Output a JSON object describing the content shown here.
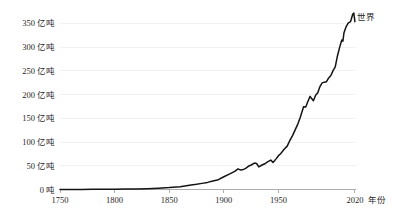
{
  "chart_data": {
    "type": "line",
    "title": "",
    "subtitle": "",
    "xlabel": "年份",
    "ylabel": "",
    "xlim": [
      1750,
      2021
    ],
    "ylim": [
      0,
      370
    ],
    "grid": true,
    "legend_position": "inline-right-of-peak",
    "unit": "亿吨",
    "y_ticks": [
      0,
      50,
      100,
      150,
      200,
      250,
      300,
      350
    ],
    "y_tick_labels": [
      "0 吨",
      "50 亿吨",
      "100 亿吨",
      "150 亿吨",
      "200 亿吨",
      "250 亿吨",
      "300 亿吨",
      "350 亿吨"
    ],
    "x_ticks": [
      1750,
      1800,
      1850,
      1900,
      1950,
      2020
    ],
    "x_tick_labels": [
      "1750",
      "1800",
      "1850",
      "1900",
      "1950",
      "2020"
    ],
    "series": [
      {
        "name": "世界",
        "label": "世界",
        "color": "#141414",
        "x": [
          1750,
          1760,
          1770,
          1780,
          1790,
          1800,
          1810,
          1820,
          1830,
          1840,
          1850,
          1860,
          1870,
          1875,
          1880,
          1885,
          1890,
          1895,
          1900,
          1905,
          1910,
          1913,
          1915,
          1918,
          1920,
          1923,
          1925,
          1928,
          1930,
          1932,
          1935,
          1938,
          1940,
          1943,
          1945,
          1946,
          1948,
          1950,
          1952,
          1955,
          1958,
          1960,
          1963,
          1965,
          1968,
          1970,
          1973,
          1975,
          1977,
          1979,
          1980,
          1982,
          1984,
          1986,
          1988,
          1990,
          1992,
          1994,
          1996,
          1998,
          2000,
          2002,
          2004,
          2006,
          2008,
          2009,
          2010,
          2012,
          2014,
          2016,
          2017,
          2018,
          2019,
          2020
        ],
        "y": [
          0.03,
          0.04,
          0.05,
          0.06,
          0.08,
          0.11,
          0.16,
          0.22,
          0.34,
          0.53,
          0.77,
          1.15,
          1.8,
          2.1,
          2.5,
          2.9,
          3.5,
          4.0,
          5.2,
          6.3,
          7.4,
          8.4,
          8.0,
          8.2,
          8.6,
          9.6,
          10.0,
          10.8,
          10.6,
          9.2,
          10.0,
          10.6,
          11.3,
          12.0,
          11.0,
          11.5,
          12.6,
          13.8,
          14.6,
          16.3,
          17.7,
          19.6,
          22.1,
          24.0,
          27.0,
          29.5,
          33.8,
          33.7,
          36.0,
          38.0,
          37.3,
          36.2,
          38.5,
          39.5,
          42.0,
          43.5,
          43.8,
          44.0,
          45.5,
          46.5,
          48.5,
          50.0,
          54.5,
          58.0,
          61.0,
          60.5,
          64.0,
          66.5,
          68.0,
          68.5,
          70.0,
          71.5,
          72.0,
          68.5
        ],
        "y_display_scale": "亿吨",
        "peak_value": 372,
        "peak_year": 2019,
        "final_value": 353,
        "final_year": 2020
      }
    ],
    "notes": [
      "Curve is near zero and flat from 1750 to about 1850.",
      "Sharp exponential rise begins after 1950.",
      "Visible dips around 1918 (WWI), 1932 (Great Depression), 1945 (WWII end), 1975 and 1980-82 (oil crises), 2009 (financial crisis), 2020 (COVID-19).",
      "Peak just before 2020 at roughly 370 亿吨 followed by a drop."
    ]
  },
  "axes": {
    "x_axis_title": "年份",
    "y_axis_title": ""
  },
  "legend": {
    "entries": [
      {
        "label": "世界"
      }
    ]
  }
}
